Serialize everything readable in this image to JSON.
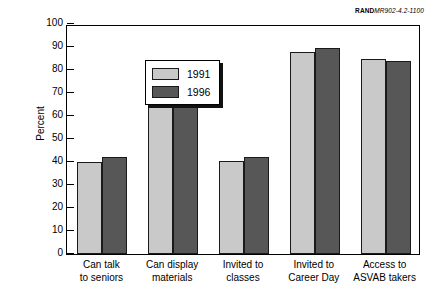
{
  "figure_id": {
    "mark": "RAND",
    "number": "MR902-4.2-1100"
  },
  "legend": {
    "entries": [
      {
        "label": "1991",
        "color": "#c9c9c9"
      },
      {
        "label": "1996",
        "color": "#575757"
      }
    ]
  },
  "chart_data": {
    "type": "bar",
    "title": "",
    "xlabel": "",
    "ylabel": "Percent",
    "ylim": [
      0,
      100
    ],
    "yticks": [
      0,
      10,
      20,
      30,
      40,
      50,
      60,
      70,
      80,
      90,
      100
    ],
    "ytick_labels": [
      "0",
      "10",
      "20",
      "30",
      "40",
      "50",
      "60",
      "70",
      "80",
      "90",
      "100"
    ],
    "grid": false,
    "legend_position": "upper-left",
    "categories": [
      "Can talk\nto seniors",
      "Can display\nmaterials",
      "Invited to\nclasses",
      "Invited to\nCareer Day",
      "Access to\nASVAB takers"
    ],
    "category_lines": [
      [
        "Can talk",
        "to seniors"
      ],
      [
        "Can display",
        "materials"
      ],
      [
        "Invited to",
        "classes"
      ],
      [
        "Invited to",
        "Career Day"
      ],
      [
        "Access to",
        "ASVAB takers"
      ]
    ],
    "series": [
      {
        "name": "1991",
        "color": "#c9c9c9",
        "values": [
          40,
          68.5,
          40.5,
          88,
          85
        ]
      },
      {
        "name": "1996",
        "color": "#575757",
        "values": [
          42,
          70.5,
          42,
          89.5,
          84
        ]
      }
    ]
  }
}
